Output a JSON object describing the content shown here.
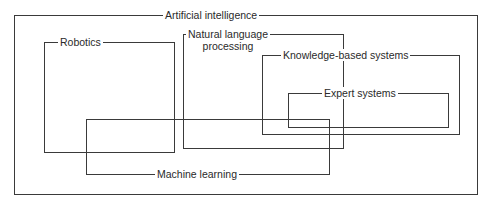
{
  "diagram": {
    "type": "nested-overlapping-sets",
    "sets": [
      {
        "id": "ai",
        "label": "Artificial intelligence"
      },
      {
        "id": "robotics",
        "label": "Robotics"
      },
      {
        "id": "nlp",
        "label_line1": "Natural language",
        "label_line2": "processing"
      },
      {
        "id": "kbs",
        "label": "Knowledge-based systems"
      },
      {
        "id": "expert",
        "label": "Expert systems"
      },
      {
        "id": "ml",
        "label": "Machine learning"
      }
    ]
  }
}
